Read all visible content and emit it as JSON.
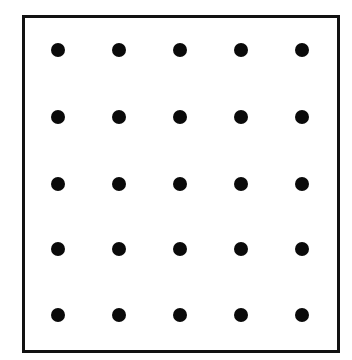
{
  "diagram": {
    "type": "dot-grid",
    "rows": 5,
    "columns": 5,
    "frame": {
      "left": 22,
      "top": 15,
      "width": 312,
      "height": 332,
      "border_width": 3,
      "border_color": "#111111"
    },
    "dot": {
      "diameter": 14,
      "color": "#0a0a0a"
    },
    "column_centers_x": [
      58,
      119,
      180,
      241,
      302
    ],
    "row_centers_y": [
      50,
      117,
      184,
      249,
      315
    ]
  }
}
